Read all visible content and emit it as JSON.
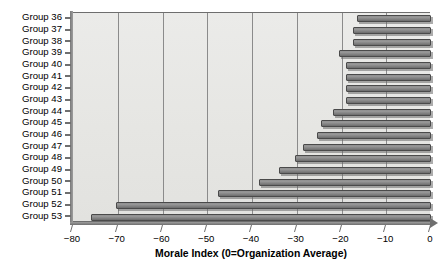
{
  "chart_data": {
    "type": "bar",
    "orientation": "horizontal",
    "title": "",
    "xlabel": "Morale Index (0=Organization Average)",
    "ylabel": "",
    "xlim": [
      -80,
      0
    ],
    "ylim": null,
    "grid": "vertical",
    "legend_position": "none",
    "xticks": [
      "−80",
      "−70",
      "−60",
      "−50",
      "−40",
      "−30",
      "−20",
      "−10",
      "0"
    ],
    "xtick_values": [
      -80,
      -70,
      -60,
      -50,
      -40,
      -30,
      -20,
      -10,
      0
    ],
    "gridline_values": [
      -70,
      -60,
      -50,
      -40,
      -30,
      -20,
      -10
    ],
    "categories": [
      "Group 36",
      "Group 37",
      "Group 38",
      "Group 39",
      "Group 40",
      "Group 41",
      "Group 42",
      "Group 43",
      "Group 44",
      "Group 45",
      "Group 46",
      "Group 47",
      "Group 48",
      "Group 49",
      "Group 50",
      "Group 51",
      "Group 52",
      "Group 53"
    ],
    "values": [
      -16.6,
      -17.5,
      -17.5,
      -20.5,
      -19.0,
      -19.0,
      -19.0,
      -19.0,
      -22.0,
      -24.5,
      -25.5,
      -28.5,
      -30.5,
      -34.0,
      -38.5,
      -47.5,
      -70.3,
      -76.0
    ],
    "bar_color": "#8a8a8a",
    "bar_edge_color": "#4a4a4a",
    "plot_background": "#e8e8e6"
  },
  "axis": {
    "x_title": "Morale Index (0=Organization Average)"
  }
}
